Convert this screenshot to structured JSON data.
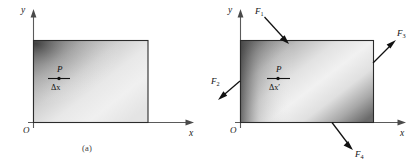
{
  "figure": {
    "type": "physics-diagram"
  },
  "panel_a": {
    "caption": "(a)",
    "axes": {
      "y_label": "y",
      "x_label": "x",
      "origin_label": "O"
    },
    "point": {
      "label": "P",
      "element_label": "Δx"
    },
    "body": {
      "name": "rectangular-body",
      "gradient": "dark top-left to light center-right",
      "edge_color": "#2b2b2b"
    }
  },
  "panel_b": {
    "caption": "(b)",
    "axes": {
      "y_label": "y",
      "x_label": "x",
      "origin_label": "O"
    },
    "point": {
      "label": "P",
      "element_label": "Δx′"
    },
    "body": {
      "name": "rectangular-body-deformed",
      "gradient": "dark left edge to light center, darkening toward bottom-right",
      "edge_color": "#2b2b2b"
    },
    "forces": [
      {
        "name": "force-f1",
        "base_label": "F",
        "subscript": "1",
        "direction": "down-right",
        "applied_at": "top-edge"
      },
      {
        "name": "force-f2",
        "base_label": "F",
        "subscript": "2",
        "direction": "down-left",
        "applied_at": "left-edge"
      },
      {
        "name": "force-f3",
        "base_label": "F",
        "subscript": "3",
        "direction": "up-right",
        "applied_at": "right-edge"
      },
      {
        "name": "force-f4",
        "base_label": "F",
        "subscript": "4",
        "direction": "down-right",
        "applied_at": "bottom-edge"
      }
    ]
  },
  "colors": {
    "axis": "#5a5a5a",
    "edge": "#2b2b2b",
    "force": "#111111",
    "background": "#ffffff"
  }
}
